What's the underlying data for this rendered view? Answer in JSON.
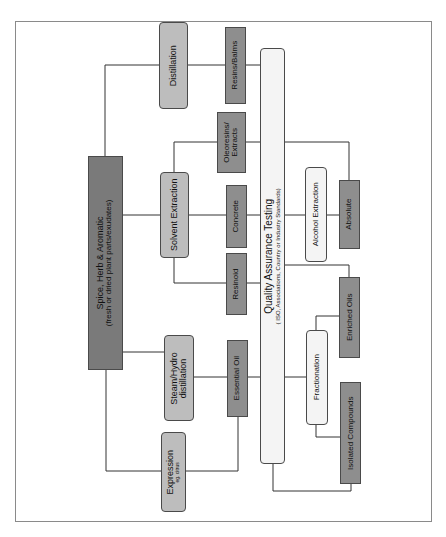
{
  "diagram": {
    "root": {
      "title": "Spice, Herb & Aromatic",
      "subtitle": "(fresh or dried plant parts/exudates)"
    },
    "processes": {
      "distillation": "Distillation",
      "solvent_extraction": "Solvent Extraction",
      "steam_hydro_line1": "Steam/Hydro",
      "steam_hydro_line2": "distillation",
      "expression": "Expression",
      "expression_note": "eg. citrus"
    },
    "products": {
      "resins_balms": "Resins/Balms",
      "oleoresins_line1": "Oleoresins/",
      "oleoresins_line2": "Extracts",
      "concrete": "Concrete",
      "resinoid": "Resinoid",
      "essential_oil": "Essential Oil"
    },
    "quality": {
      "title": "Quality Assurance Testing",
      "subtitle": "( ISO, Associations, Country or Industry Standards)"
    },
    "secondary": {
      "alcohol_extraction": "Alcohol Extraction",
      "absolute": "Absolute",
      "fractionation": "Fractionation",
      "enriched_oils": "Enriched Oils",
      "isolated_compounds": "Isolated Compounds"
    },
    "colors": {
      "root": "#7a7a7a",
      "product": "#8e8e8e",
      "process": "#bdbdbd",
      "quality": "#f4f4f4",
      "line": "#333333"
    }
  }
}
